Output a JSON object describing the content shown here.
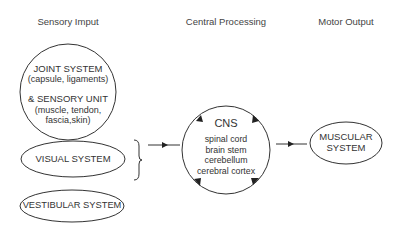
{
  "headers": {
    "sensory": "Sensory Imput",
    "central": "Central Processing",
    "motor": "Motor Output"
  },
  "sensory_input": {
    "joint": {
      "line1": "JOINT SYSTEM",
      "line2": "(capsule, ligaments)",
      "line3": "& SENSORY UNIT",
      "line4": "(muscle, tendon,",
      "line5": "fascia,skin)"
    },
    "visual": "VISUAL SYSTEM",
    "vestibular": "VESTIBULAR SYSTEM"
  },
  "central_processing": {
    "title": "CNS",
    "items": [
      "spinal cord",
      "brain stem",
      "cerebellum",
      "cerebral cortex"
    ]
  },
  "motor_output": {
    "line1": "MUSCULAR",
    "line2": "SYSTEM"
  },
  "colors": {
    "stroke": "#333333",
    "background": "#ffffff"
  }
}
